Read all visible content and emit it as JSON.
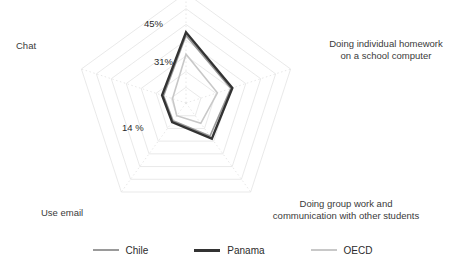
{
  "chart_data": {
    "type": "radar",
    "title": "",
    "subtitle": "",
    "xlabel": "",
    "ylabel": "",
    "grid": true,
    "grid_rings": 7,
    "legend_position": "bottom",
    "axis_max": 70,
    "axis_min": 0,
    "categories": [
      "Doing individual homework on a school computer",
      "Doing group work and communication with other students",
      "Use email",
      "Chat",
      "Browse the Internet for schoolwork"
    ],
    "annotations": [
      {
        "text": "45%",
        "series": "Panama",
        "axis": "Browse the Internet for schoolwork"
      },
      {
        "text": "31%",
        "series": "OECD",
        "axis": "Browse the Internet for schoolwork"
      },
      {
        "text": "14 %",
        "series": "OECD",
        "axis": "Chat"
      }
    ],
    "series": [
      {
        "name": "Chile",
        "color": "#9a9a9a",
        "values": [
          30,
          26,
          14,
          15,
          43
        ]
      },
      {
        "name": "Panama",
        "color": "#333333",
        "values": [
          31,
          28,
          15,
          16,
          45
        ]
      },
      {
        "name": "OECD",
        "color": "#c8c8c8",
        "values": [
          21,
          16,
          10,
          9,
          31
        ]
      }
    ]
  },
  "axes": [
    {
      "id": "homework",
      "label": "Doing individual homework\non a school computer",
      "line1": "Doing individual homework",
      "line2": "on a school computer"
    },
    {
      "id": "groupwork",
      "label": "Doing group work and\ncommunication with other students",
      "line1": "Doing group work and",
      "line2": "communication with other students"
    },
    {
      "id": "email",
      "label": "Use email"
    },
    {
      "id": "chat",
      "label": "Chat"
    }
  ],
  "value_labels": [
    {
      "id": "v45",
      "text": "45%"
    },
    {
      "id": "v31",
      "text": "31%"
    },
    {
      "id": "v14",
      "text": "14 %"
    }
  ],
  "legend": {
    "items": [
      {
        "label": "Chile",
        "color": "#9a9a9a",
        "width": "2px"
      },
      {
        "label": "Panama",
        "color": "#333333",
        "width": "3px"
      },
      {
        "label": "OECD",
        "color": "#c8c8c8",
        "width": "2px"
      }
    ]
  },
  "colors": {
    "grid": "#e3e3e3",
    "grid_dotted": "#dcdcdc",
    "text": "#2b2b2b",
    "background": "#ffffff"
  }
}
